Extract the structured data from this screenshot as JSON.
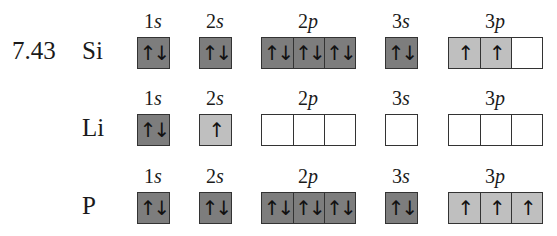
{
  "problem_number": "7.43",
  "colors": {
    "full": "#7d7d7d",
    "half": "#bfbfbf",
    "empty": "#ffffff",
    "border": "#333333"
  },
  "rows": [
    {
      "element": "Si",
      "subshells": [
        {
          "label_num": "1",
          "label_letter": "s",
          "orbitals": [
            "↑↓"
          ]
        },
        {
          "label_num": "2",
          "label_letter": "s",
          "orbitals": [
            "↑↓"
          ]
        },
        {
          "label_num": "2",
          "label_letter": "p",
          "orbitals": [
            "↑↓",
            "↑↓",
            "↑↓"
          ]
        },
        {
          "label_num": "3",
          "label_letter": "s",
          "orbitals": [
            "↑↓"
          ]
        },
        {
          "label_num": "3",
          "label_letter": "p",
          "orbitals": [
            "↑",
            "↑",
            ""
          ]
        }
      ]
    },
    {
      "element": "Li",
      "subshells": [
        {
          "label_num": "1",
          "label_letter": "s",
          "orbitals": [
            "↑↓"
          ]
        },
        {
          "label_num": "2",
          "label_letter": "s",
          "orbitals": [
            "↑"
          ]
        },
        {
          "label_num": "2",
          "label_letter": "p",
          "orbitals": [
            "",
            "",
            ""
          ]
        },
        {
          "label_num": "3",
          "label_letter": "s",
          "orbitals": [
            ""
          ]
        },
        {
          "label_num": "3",
          "label_letter": "p",
          "orbitals": [
            "",
            "",
            ""
          ]
        }
      ]
    },
    {
      "element": "P",
      "subshells": [
        {
          "label_num": "1",
          "label_letter": "s",
          "orbitals": [
            "↑↓"
          ]
        },
        {
          "label_num": "2",
          "label_letter": "s",
          "orbitals": [
            "↑↓"
          ]
        },
        {
          "label_num": "2",
          "label_letter": "p",
          "orbitals": [
            "↑↓",
            "↑↓",
            "↑↓"
          ]
        },
        {
          "label_num": "3",
          "label_letter": "s",
          "orbitals": [
            "↑↓"
          ]
        },
        {
          "label_num": "3",
          "label_letter": "p",
          "orbitals": [
            "↑",
            "↑",
            "↑"
          ]
        }
      ]
    }
  ]
}
